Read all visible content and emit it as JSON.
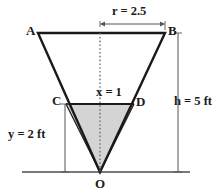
{
  "figure": {
    "colors": {
      "stroke": "#1a1a1a",
      "shaded_fill": "#d4d4d4",
      "dimension_line": "#555555",
      "ground_line": "#4d4d4d",
      "background": "#ffffff"
    },
    "vertices": {
      "A": "A",
      "B": "B",
      "C": "C",
      "D": "D",
      "O": "O"
    },
    "dimensions": {
      "radius": "r = 2.5",
      "inner_radius": "x = 1",
      "height": "h = 5 ft",
      "inner_height": "y = 2 ft"
    },
    "geometry": {
      "outer_triangle": "38,33 165,33 100,172",
      "inner_triangle": "66,104 134,104 100,172",
      "top_edge": {
        "x1": 38,
        "y1": 33,
        "x2": 165,
        "y2": 33
      },
      "cd_edge": {
        "x1": 66,
        "y1": 104,
        "x2": 134,
        "y2": 104
      },
      "center_axis": {
        "x": 100,
        "y1": 33,
        "y2": 172
      },
      "ground_line": {
        "x1": 22,
        "y1": 172,
        "x2": 190,
        "y2": 172
      },
      "r_dimension": {
        "x1": 100,
        "x2": 165,
        "y": 24
      },
      "h_dimension": {
        "x": 178,
        "y1": 33,
        "y2": 172
      },
      "y_dimension": {
        "x": 65,
        "y1": 104,
        "y2": 172
      }
    }
  }
}
